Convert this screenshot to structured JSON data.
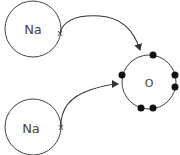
{
  "diagram": {
    "title": "",
    "atoms": [
      {
        "id": "na-top",
        "label": "Na"
      },
      {
        "id": "na-bottom",
        "label": "Na"
      },
      {
        "id": "oxygen",
        "label": "O"
      }
    ],
    "electron_transfer_marker": "x",
    "oxygen_outer_electrons": 6,
    "colors": {
      "stroke": "#333333",
      "text": "#444444",
      "electron": "#111111"
    }
  }
}
